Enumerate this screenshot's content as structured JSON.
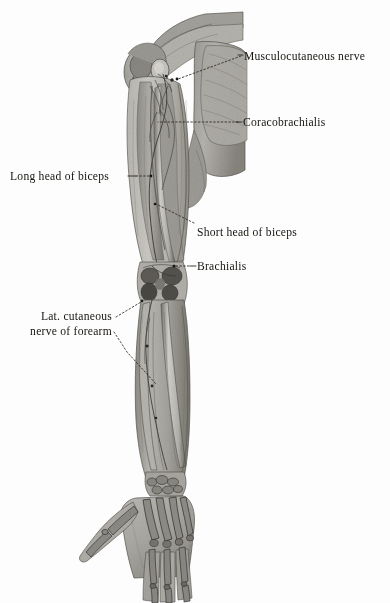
{
  "figure": {
    "caption": "",
    "style": "grayscale halftone anatomical plate",
    "background_color": "#fdfdfd",
    "ink_color": "#16140f",
    "tones": {
      "skin_light": "#cfcdc8",
      "muscle_mid": "#a8a6a0",
      "muscle_dark": "#7d7b76",
      "bone_light": "#dedcd6",
      "bone_shadow": "#6e6c67",
      "deep_shadow": "#3e3c38",
      "outline": "#4a4843"
    },
    "regions": [
      {
        "name": "shoulder-deltoid",
        "label": "deltoid and shoulder region"
      },
      {
        "name": "upper-arm",
        "label": "arm with biceps brachii and brachialis"
      },
      {
        "name": "elbow",
        "label": "elbow joint / cubital fossa"
      },
      {
        "name": "forearm",
        "label": "forearm with radius and ulna"
      },
      {
        "name": "hand",
        "label": "hand skeleton, palmar aspect"
      }
    ]
  },
  "labels": [
    {
      "id": "musculocutaneous-nerve",
      "text": "Musculocutaneous nerve",
      "lines": [
        "Musculocutaneous nerve"
      ],
      "x": 244,
      "y": 49,
      "leader": {
        "type": "dashed",
        "from": [
          241,
          56
        ],
        "to": [
          178,
          79
        ]
      }
    },
    {
      "id": "coracobrachialis",
      "text": "Coracobrachialis",
      "lines": [
        "Coracobrachialis"
      ],
      "x": 243,
      "y": 115,
      "leader": {
        "type": "dashed",
        "from": [
          240,
          122
        ],
        "to": [
          156,
          122
        ]
      }
    },
    {
      "id": "long-head-of-biceps",
      "text": "Long head of biceps",
      "lines": [
        "Long head of biceps"
      ],
      "x": 10,
      "y": 169,
      "leader": {
        "type": "dashed",
        "from": [
          127,
          176
        ],
        "to": [
          149,
          176
        ]
      }
    },
    {
      "id": "short-head-of-biceps",
      "text": "Short head of biceps",
      "lines": [
        "Short head of biceps"
      ],
      "x": 197,
      "y": 225,
      "leader": {
        "type": "dashed",
        "from": [
          194,
          223
        ],
        "to": [
          155,
          204
        ]
      }
    },
    {
      "id": "brachialis",
      "text": "Brachialis",
      "lines": [
        "Brachialis"
      ],
      "x": 197,
      "y": 259,
      "leader": {
        "type": "dashed",
        "from": [
          194,
          266
        ],
        "to": [
          172,
          266
        ]
      }
    },
    {
      "id": "lat-cutaneous-nerve-of-forearm",
      "text": "Lat. cutaneous nerve of forearm",
      "lines": [
        "Lat. cutaneous",
        "nerve of forearm"
      ],
      "x": 14,
      "y": 309,
      "leader": {
        "type": "dashed",
        "from": [
          116,
          317
        ],
        "to": [
          141,
          302
        ]
      },
      "leader2": {
        "type": "dashed",
        "from": [
          114,
          332
        ],
        "to": [
          156,
          384
        ]
      }
    }
  ],
  "meta": {
    "width": 390,
    "height": 603
  }
}
